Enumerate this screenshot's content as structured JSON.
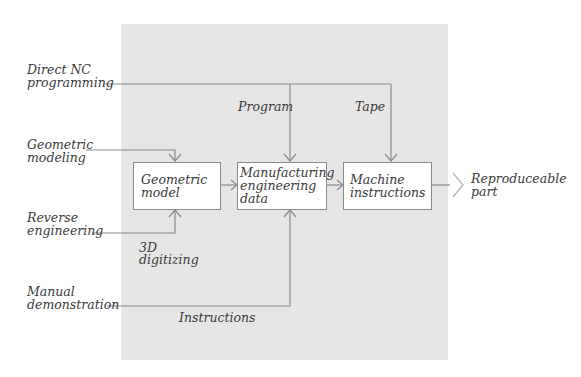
{
  "diagram": {
    "title": "",
    "inputs": {
      "direct_nc": {
        "line1": "Direct NC",
        "line2": "programming"
      },
      "geometric_modeling": {
        "line1": "Geometric",
        "line2": "modeling"
      },
      "reverse_engineering": {
        "line1": "Reverse",
        "line2": "engineering"
      },
      "manual_demonstration": {
        "line1": "Manual",
        "line2": "demonstration"
      }
    },
    "edge_labels": {
      "program": "Program",
      "tape": "Tape",
      "digitizing_line1": "3D",
      "digitizing_line2": "digitizing",
      "instructions": "Instructions"
    },
    "boxes": [
      {
        "id": "geometric-model",
        "lines": [
          "Geometric",
          "model"
        ]
      },
      {
        "id": "manufacturing-engineering-data",
        "lines": [
          "Manufacturing",
          "engineering",
          "data"
        ]
      },
      {
        "id": "machine-instructions",
        "lines": [
          "Machine",
          "instructions"
        ]
      }
    ],
    "output": {
      "line1": "Reproduceable",
      "line2": "part"
    },
    "colors": {
      "panel": "#e6e6e6",
      "line": "#8a8a8a",
      "text": "#3a3a3a",
      "box": "#ffffff"
    }
  }
}
